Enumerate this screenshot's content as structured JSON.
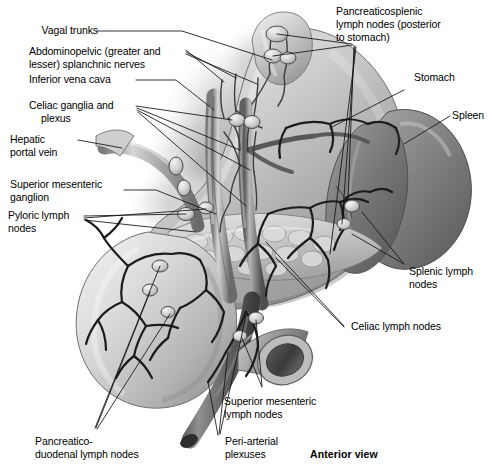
{
  "figure": {
    "title_note": "Anterior view",
    "view_label": "Anterior view",
    "style": "grayscale medical illustration",
    "ink": "#000000",
    "paper": "#ffffff"
  },
  "labels": {
    "vagal_trunks": "Vagal trunks",
    "abdominopelvic_l1": "Abdominopelvic (greater and",
    "abdominopelvic_l2": "lesser) splanchnic nerves",
    "inferior_vena_cava": "Inferior vena cava",
    "celiac_ganglia_l1": "Celiac ganglia and",
    "celiac_ganglia_l2": "plexus",
    "hepatic_portal_l1": "Hepatic",
    "hepatic_portal_l2": "portal vein",
    "superior_mesenteric_ganglion_l1": "Superior mesenteric",
    "superior_mesenteric_ganglion_l2": "ganglion",
    "pyloric_lymph_l1": "Pyloric lymph",
    "pyloric_lymph_l2": "nodes",
    "pancreaticosplenic_l1": "Pancreaticosplenic",
    "pancreaticosplenic_l2": "lymph nodes (posterior",
    "pancreaticosplenic_l3": "to stomach)",
    "stomach": "Stomach",
    "spleen": "Spleen",
    "splenic_lymph_l1": "Splenic lymph",
    "splenic_lymph_l2": "nodes",
    "celiac_lymph_nodes": "Celiac lymph nodes",
    "superior_mesenteric_lymph_l1": "Superior mesenteric",
    "superior_mesenteric_lymph_l2": "lymph nodes",
    "pancreaticoduodenal_l1": "Pancreatico-",
    "pancreaticoduodenal_l2": "duodenal lymph nodes",
    "periarterial_l1": "Peri-arterial",
    "periarterial_l2": "plexuses",
    "anterior_view": "Anterior view"
  },
  "structures": [
    {
      "name": "stomach",
      "label": "Stomach"
    },
    {
      "name": "spleen",
      "label": "Spleen"
    },
    {
      "name": "duodenum",
      "label": "Duodenum"
    },
    {
      "name": "pancreas",
      "label": "Pancreas"
    },
    {
      "name": "inferior-vena-cava",
      "label": "Inferior vena cava"
    },
    {
      "name": "hepatic-portal-vein",
      "label": "Hepatic portal vein"
    },
    {
      "name": "abdominal-aorta",
      "label": "Abdominal aorta"
    },
    {
      "name": "superior-mesenteric-artery",
      "label": "Superior mesenteric artery"
    }
  ]
}
